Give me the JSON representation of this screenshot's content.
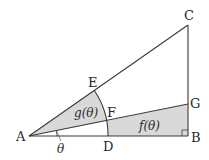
{
  "diagram": {
    "type": "geometry",
    "colors": {
      "stroke": "#3a3a3a",
      "shade": "#d9d9d9",
      "background": "#ffffff"
    },
    "points": {
      "A": {
        "label": "A",
        "x": 29,
        "y": 136
      },
      "B": {
        "label": "B",
        "x": 188,
        "y": 136
      },
      "C": {
        "label": "C",
        "x": 188,
        "y": 25
      },
      "D": {
        "label": "D",
        "x": 108,
        "y": 136
      },
      "E": {
        "label": "E",
        "x": 94,
        "y": 90
      },
      "F": {
        "label": "F",
        "x": 107,
        "y": 121
      },
      "G": {
        "label": "G",
        "x": 188,
        "y": 104
      }
    },
    "regions": {
      "g": {
        "label": "g(θ)",
        "description": "sector A-E-F bounded by AE, arc EF, and FA"
      },
      "f": {
        "label": "f(θ)",
        "description": "region D-B-G-F bounded by DB, BG, GF, and arc FD"
      }
    },
    "angle": {
      "label": "θ",
      "vertex": "A",
      "between": [
        "AD",
        "AG"
      ]
    },
    "right_angle_marker": "B"
  }
}
